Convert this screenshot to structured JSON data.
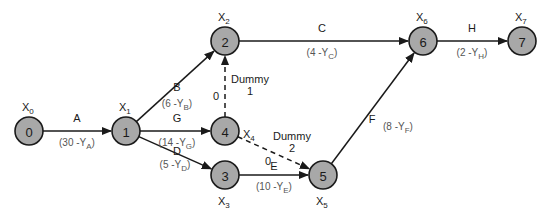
{
  "diagram": {
    "type": "activity-on-arrow network",
    "colors": {
      "node_fill": "#a8a8a8",
      "stroke": "#1a1a1a",
      "duration_text": "#555555"
    },
    "nodes": [
      {
        "id": "0",
        "label": "0",
        "var": "X",
        "sub": "0",
        "x": 29,
        "y": 131
      },
      {
        "id": "1",
        "label": "1",
        "var": "X",
        "sub": "1",
        "x": 126,
        "y": 131
      },
      {
        "id": "2",
        "label": "2",
        "var": "X",
        "sub": "2",
        "x": 225,
        "y": 41
      },
      {
        "id": "3",
        "label": "3",
        "var": "X",
        "sub": "3",
        "x": 225,
        "y": 175
      },
      {
        "id": "4",
        "label": "4",
        "var": "X",
        "sub": "4",
        "x": 225,
        "y": 131
      },
      {
        "id": "5",
        "label": "5",
        "var": "X",
        "sub": "5",
        "x": 323,
        "y": 175
      },
      {
        "id": "6",
        "label": "6",
        "var": "X",
        "sub": "6",
        "x": 423,
        "y": 41
      },
      {
        "id": "7",
        "label": "7",
        "var": "X",
        "sub": "7",
        "x": 522,
        "y": 41
      }
    ],
    "edges": [
      {
        "from": "0",
        "to": "1",
        "label": "A",
        "duration": "(30 -Y",
        "dsub": "A",
        "dashed": false
      },
      {
        "from": "1",
        "to": "2",
        "label": "B",
        "duration": "(6 -Y",
        "dsub": "B",
        "dashed": false
      },
      {
        "from": "1",
        "to": "4",
        "label": "G",
        "duration": "(14 -Y",
        "dsub": "G",
        "dashed": false
      },
      {
        "from": "1",
        "to": "3",
        "label": "D",
        "duration": "(5 -Y",
        "dsub": "D",
        "dashed": false
      },
      {
        "from": "2",
        "to": "6",
        "label": "C",
        "duration": "(4 -Y",
        "dsub": "C",
        "dashed": false
      },
      {
        "from": "4",
        "to": "2",
        "label": "Dummy 1",
        "label_line1": "Dummy",
        "label_line2": "1",
        "duration": "0",
        "dashed": true
      },
      {
        "from": "4",
        "to": "5",
        "label": "Dummy 2",
        "label_line1": "Dummy",
        "label_line2": "2",
        "duration": "0",
        "dashed": true
      },
      {
        "from": "3",
        "to": "5",
        "label": "E",
        "duration": "(10 -Y",
        "dsub": "E",
        "dashed": false
      },
      {
        "from": "5",
        "to": "6",
        "label": "F",
        "duration": "(8 -Y",
        "dsub": "F",
        "dashed": false
      },
      {
        "from": "6",
        "to": "7",
        "label": "H",
        "duration": "(2 -Y",
        "dsub": "H",
        "dashed": false
      }
    ]
  }
}
